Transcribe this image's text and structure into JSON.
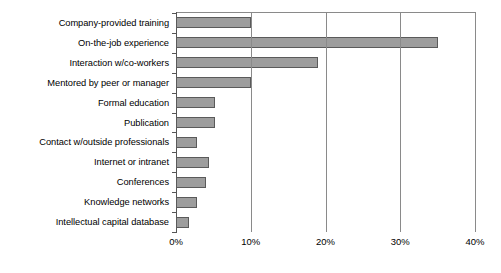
{
  "chart_data": {
    "type": "bar",
    "orientation": "horizontal",
    "title": "",
    "subtitle": "",
    "xlabel": "",
    "ylabel": "",
    "grid": true,
    "legend": null,
    "xlim": [
      0,
      40
    ],
    "xtick_labels": [
      "0%",
      "10%",
      "20%",
      "30%",
      "40%"
    ],
    "xticks": [
      0,
      10,
      20,
      30,
      40
    ],
    "categories": [
      "Company-provided training",
      "On-the-job experience",
      "Interaction w/co-workers",
      "Mentored by peer or manager",
      "Formal education",
      "Publication",
      "Contact w/outside professionals",
      "Internet or intranet",
      "Conferences",
      "Knowledge networks",
      "Intellectual capital database"
    ],
    "values": [
      10.0,
      35.0,
      19.0,
      10.0,
      5.2,
      5.2,
      2.8,
      4.4,
      4.0,
      2.8,
      1.7
    ],
    "value_unit": "%",
    "colors": {
      "bar_fill": "#9d9d9d",
      "bar_border": "#5a5a5a",
      "gridline": "#8a8a8a",
      "axis": "#555555",
      "text": "#000000",
      "background": "#ffffff"
    }
  }
}
